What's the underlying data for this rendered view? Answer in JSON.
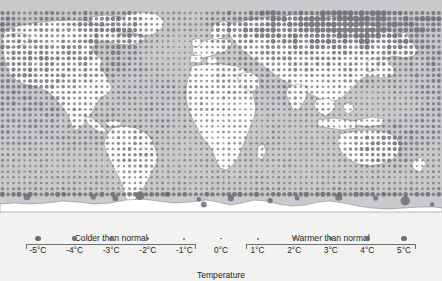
{
  "figure": {
    "top_crop_text": "",
    "background_color": "#f2f2f0"
  },
  "map": {
    "name": "world-temperature-anomaly-map",
    "projection": "equirectangular",
    "ocean_color": "#c9cacb",
    "land_color": "#ffffff",
    "coastline_color": "#6d6e71",
    "dot_color": "#6e7076",
    "antarctica_label": "Antarctica"
  },
  "legend": {
    "name": "temperature-anomaly-legend",
    "axis_title": "Temperature",
    "groups": [
      {
        "label": "Colder than normal",
        "from": "-5°C",
        "to": "-1°C"
      },
      {
        "label": "Warmer than normal",
        "from": "1°C",
        "to": "5°C"
      }
    ],
    "items": [
      {
        "label": "-5°C",
        "value": -5,
        "dot_px": 5.2
      },
      {
        "label": "-4°C",
        "value": -4,
        "dot_px": 4.4
      },
      {
        "label": "-3°C",
        "value": -3,
        "dot_px": 3.6
      },
      {
        "label": "-2°C",
        "value": -2,
        "dot_px": 2.8
      },
      {
        "label": "-1°C",
        "value": -1,
        "dot_px": 2.0
      },
      {
        "label": "0°C",
        "value": 0,
        "dot_px": 1.2
      },
      {
        "label": "1°C",
        "value": 1,
        "dot_px": 2.0
      },
      {
        "label": "2°C",
        "value": 2,
        "dot_px": 2.8
      },
      {
        "label": "3°C",
        "value": 3,
        "dot_px": 3.6
      },
      {
        "label": "4°C",
        "value": 4,
        "dot_px": 4.4
      },
      {
        "label": "5°C",
        "value": 5,
        "dot_px": 5.2
      }
    ]
  },
  "chart_data": {
    "type": "scatter",
    "title": "",
    "subtitle": "",
    "xlabel": "Longitude",
    "ylabel": "Latitude",
    "legend_title": "Temperature",
    "legend_position": "bottom",
    "grid": false,
    "xlim": [
      -180,
      180
    ],
    "ylim": [
      -90,
      90
    ],
    "size_encoding": {
      "variable": "temperature_anomaly_degC",
      "unit": "°C",
      "domain": [
        -5,
        5
      ],
      "zero_is_smallest": true,
      "note": "Dot area grows with the absolute magnitude of the anomaly; 0°C is the smallest dot."
    },
    "categories": [
      "-5°C",
      "-4°C",
      "-3°C",
      "-2°C",
      "-1°C",
      "0°C",
      "1°C",
      "2°C",
      "3°C",
      "4°C",
      "5°C"
    ],
    "values": [
      -5,
      -4,
      -3,
      -2,
      -1,
      0,
      1,
      2,
      3,
      4,
      5
    ],
    "annotations": [
      "Colder than normal",
      "Warmer than normal",
      "Temperature"
    ],
    "grid_spacing_deg": 4.5,
    "regions": [
      {
        "name": "North Pacific",
        "lon": [
          -180,
          -125
        ],
        "lat": [
          25,
          60
        ],
        "anomaly": 3.2
      },
      {
        "name": "Alaska / NW Canada",
        "lon": [
          -165,
          -115
        ],
        "lat": [
          55,
          75
        ],
        "anomaly": 2.4
      },
      {
        "name": "Canada interior",
        "lon": [
          -120,
          -70
        ],
        "lat": [
          48,
          72
        ],
        "anomaly": 3.6
      },
      {
        "name": "Greenland",
        "lon": [
          -55,
          -20
        ],
        "lat": [
          60,
          83
        ],
        "anomaly": 1.6
      },
      {
        "name": "Contiguous US",
        "lon": [
          -125,
          -70
        ],
        "lat": [
          28,
          48
        ],
        "anomaly": 3.0
      },
      {
        "name": "Mexico / Caribbean",
        "lon": [
          -110,
          -60
        ],
        "lat": [
          10,
          28
        ],
        "anomaly": 2.0
      },
      {
        "name": "Amazon / N. Brazil",
        "lon": [
          -75,
          -40
        ],
        "lat": [
          -15,
          8
        ],
        "anomaly": 2.2
      },
      {
        "name": "Southern S. America",
        "lon": [
          -78,
          -55
        ],
        "lat": [
          -55,
          -20
        ],
        "anomaly": 2.6
      },
      {
        "name": "S. Atlantic",
        "lon": [
          -45,
          0
        ],
        "lat": [
          -50,
          -15
        ],
        "anomaly": 1.6
      },
      {
        "name": "North Atlantic",
        "lon": [
          -60,
          -10
        ],
        "lat": [
          35,
          60
        ],
        "anomaly": 1.2
      },
      {
        "name": "Western Europe",
        "lon": [
          -10,
          25
        ],
        "lat": [
          40,
          60
        ],
        "anomaly": 2.6
      },
      {
        "name": "Northern Europe",
        "lon": [
          5,
          45
        ],
        "lat": [
          58,
          72
        ],
        "anomaly": 3.4
      },
      {
        "name": "North Africa / Sahara",
        "lon": [
          -15,
          35
        ],
        "lat": [
          12,
          32
        ],
        "anomaly": 2.4
      },
      {
        "name": "Central Africa",
        "lon": [
          8,
          40
        ],
        "lat": [
          -12,
          12
        ],
        "anomaly": 1.6
      },
      {
        "name": "Southern Africa",
        "lon": [
          12,
          40
        ],
        "lat": [
          -35,
          -12
        ],
        "anomaly": 1.8
      },
      {
        "name": "Middle East",
        "lon": [
          35,
          62
        ],
        "lat": [
          14,
          40
        ],
        "anomaly": 2.6
      },
      {
        "name": "Western Siberia",
        "lon": [
          45,
          90
        ],
        "lat": [
          55,
          75
        ],
        "anomaly": 4.2
      },
      {
        "name": "Central Siberia",
        "lon": [
          90,
          140
        ],
        "lat": [
          55,
          78
        ],
        "anomaly": 4.8
      },
      {
        "name": "Eastern Siberia",
        "lon": [
          130,
          180
        ],
        "lat": [
          58,
          75
        ],
        "anomaly": 3.6
      },
      {
        "name": "Central Asia",
        "lon": [
          55,
          100
        ],
        "lat": [
          35,
          55
        ],
        "anomaly": 3.0
      },
      {
        "name": "China / East Asia",
        "lon": [
          100,
          140
        ],
        "lat": [
          22,
          48
        ],
        "anomaly": 2.6
      },
      {
        "name": "India / South Asia",
        "lon": [
          68,
          95
        ],
        "lat": [
          8,
          32
        ],
        "anomaly": 2.0
      },
      {
        "name": "SE Asia / Maritime",
        "lon": [
          95,
          140
        ],
        "lat": [
          -10,
          20
        ],
        "anomaly": 1.4
      },
      {
        "name": "Indian Ocean",
        "lon": [
          50,
          100
        ],
        "lat": [
          -40,
          -5
        ],
        "anomaly": 1.6
      },
      {
        "name": "Australia",
        "lon": [
          112,
          155
        ],
        "lat": [
          -40,
          -11
        ],
        "anomaly": 3.2
      },
      {
        "name": "New Zealand / Tasman",
        "lon": [
          155,
          180
        ],
        "lat": [
          -48,
          -30
        ],
        "anomaly": 1.8
      },
      {
        "name": "Southern Ocean",
        "lon": [
          -180,
          180
        ],
        "lat": [
          -62,
          -42
        ],
        "anomaly": 1.6
      },
      {
        "name": "Antarctic coast",
        "lon": [
          -180,
          180
        ],
        "lat": [
          -75,
          -64
        ],
        "anomaly": 4.4
      }
    ]
  }
}
